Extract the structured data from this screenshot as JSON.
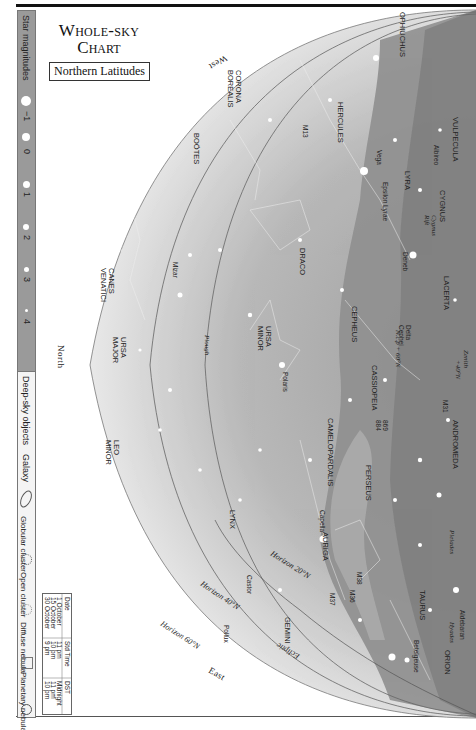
{
  "header": {
    "title_line1": "Whole-sky",
    "title_line2": "Chart",
    "subtitle": "Northern Latitudes"
  },
  "legend": {
    "star_magnitudes_label": "Star magnitudes",
    "magnitudes": [
      "−1",
      "0",
      "1",
      "2",
      "3",
      "4",
      "5"
    ],
    "deep_sky_label": "Deep-sky objects",
    "deep_sky_types": [
      {
        "label": "Galaxy",
        "icon": "ellipse-icon"
      },
      {
        "label": "Globular cluster",
        "icon": "dotted-circle-icon"
      },
      {
        "label": "Open cluster",
        "icon": "dot-cluster-icon"
      },
      {
        "label": "Diffuse nebula",
        "icon": "square-icon"
      },
      {
        "label": "Planetary nebula",
        "icon": "ringed-circle-icon"
      }
    ]
  },
  "time_table": {
    "headers": [
      "Date",
      "Std Time",
      "DST"
    ],
    "rows": [
      [
        "1 October",
        "11 pm",
        "Midnight"
      ],
      [
        "15 October",
        "10 pm",
        "11 pm"
      ],
      [
        "30 October",
        "9 pm",
        "10 pm"
      ]
    ]
  },
  "compass": {
    "north": "North",
    "east": "East",
    "west": "West"
  },
  "horizons": [
    "Horizon 20°N",
    "Horizon 40°N",
    "Horizon 60°N"
  ],
  "annotations": {
    "zenith": "Zenith 40°N",
    "ecliptic": "Ecliptic",
    "ncp": "N.c.p + 60°N",
    "plough": "Plough",
    "pleiades": "Pleiades",
    "hyades": "Hyades",
    "cygnus_rift": "Cygnus Rift"
  },
  "constellations": [
    "OPHIUCHUS",
    "VULPECULA",
    "HERCULES",
    "LYRA",
    "CYGNUS",
    "CORONA BOREALIS",
    "BOÖTES",
    "DRACO",
    "LACERTA",
    "CEPHEUS",
    "CASSIOPEIA",
    "ANDROMEDA",
    "URSA MINOR",
    "URSA MAJOR",
    "CANES VENATICI",
    "LEO MINOR",
    "CAMELOPARDALIS",
    "PERSEUS",
    "LYNX",
    "AURIGA",
    "TAURUS",
    "ORION",
    "GEMINI"
  ],
  "stars": [
    "Vega",
    "Epsilon Lyrae",
    "Albireo",
    "Deneb",
    "Delta Cephei",
    "Polaris",
    "Mizar",
    "Capella",
    "Castor",
    "Pollux",
    "Aldebaran",
    "Betelgeuse"
  ],
  "deep_sky_objects": [
    "M13",
    "M31",
    "869",
    "884",
    "M36",
    "M37",
    "M38"
  ],
  "colors": {
    "milky_way_dark": "#8d8d8d",
    "milky_way_mid": "#a8a8a8",
    "sky_outer": "#f0f0f0",
    "sky_inner": "#b5b5b5",
    "sidebar": "#9a9a9a"
  }
}
